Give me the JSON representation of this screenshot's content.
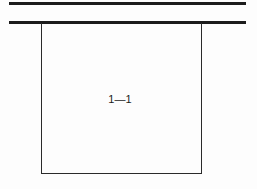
{
  "figure": {
    "type": "technical-line-drawing",
    "width": 257,
    "height": 189,
    "background_color": "#fdfdfd",
    "line_color": "#1c1c1c",
    "outline_color": "#2a2a2a",
    "label": "1—1",
    "label_position": {
      "x": 120,
      "y": 99
    },
    "rules": [
      {
        "name": "upper-rule",
        "y": 3.5,
        "x_start": 9,
        "x_end": 246,
        "thickness": 2.1
      },
      {
        "name": "lower-rule",
        "y": 22.5,
        "x_start": 9,
        "x_end": 246,
        "thickness": 2.1
      }
    ],
    "box": {
      "name": "section-box",
      "left": 41,
      "top": 22.5,
      "right": 201,
      "bottom": 174,
      "width": 160,
      "height": 151.5,
      "thickness": 1.6
    }
  }
}
